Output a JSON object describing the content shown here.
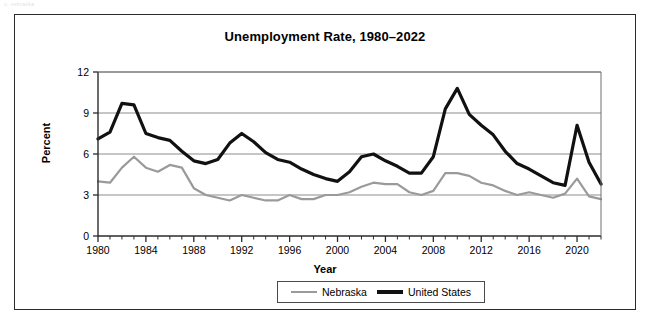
{
  "scan_artifact": {
    "text": "u. nebraska"
  },
  "figure": {
    "title": "Unemployment Rate, 1980–2022",
    "x_axis_title": "Year",
    "y_axis_title": "Percent"
  },
  "legend": {
    "position": "bottom-center",
    "entries": [
      {
        "label": "Nebraska",
        "color": "#9a9a9a",
        "swatch": "line-swatch-nebraska"
      },
      {
        "label": "United States",
        "color": "#111111",
        "swatch": "line-swatch-united-states"
      }
    ]
  },
  "chart_data": {
    "type": "line",
    "title": "Unemployment Rate, 1980–2022",
    "xlabel": "Year",
    "ylabel": "Percent",
    "xlim": [
      1980,
      2022
    ],
    "ylim": [
      0,
      12
    ],
    "ytick_labels": [
      "0",
      "3",
      "6",
      "9",
      "12"
    ],
    "yticks": [
      0,
      3,
      6,
      9,
      12
    ],
    "xtick_labels": [
      "1980",
      "1984",
      "1988",
      "1992",
      "1996",
      "2000",
      "2004",
      "2008",
      "2012",
      "2016",
      "2020"
    ],
    "xticks_labeled": [
      1980,
      1984,
      1988,
      1992,
      1996,
      2000,
      2004,
      2008,
      2012,
      2016,
      2020
    ],
    "minor_tick_interval_years": 1,
    "grid": "horizontal-only",
    "legend_position": "bottom-center",
    "x": [
      1980,
      1981,
      1982,
      1983,
      1984,
      1985,
      1986,
      1987,
      1988,
      1989,
      1990,
      1991,
      1992,
      1993,
      1994,
      1995,
      1996,
      1997,
      1998,
      1999,
      2000,
      2001,
      2002,
      2003,
      2004,
      2005,
      2006,
      2007,
      2008,
      2009,
      2010,
      2011,
      2012,
      2013,
      2014,
      2015,
      2016,
      2017,
      2018,
      2019,
      2020,
      2021,
      2022
    ],
    "series": [
      {
        "name": "Nebraska",
        "color": "#9a9a9a",
        "line_width": 2.2,
        "values": [
          4.0,
          3.9,
          5.0,
          5.8,
          5.0,
          4.7,
          5.2,
          5.0,
          3.5,
          3.0,
          2.8,
          2.6,
          3.0,
          2.8,
          2.6,
          2.6,
          3.0,
          2.7,
          2.7,
          3.0,
          3.0,
          3.2,
          3.6,
          3.9,
          3.8,
          3.8,
          3.2,
          3.0,
          3.3,
          4.6,
          4.6,
          4.4,
          3.9,
          3.7,
          3.3,
          3.0,
          3.2,
          3.0,
          2.8,
          3.1,
          4.2,
          2.9,
          2.7
        ]
      },
      {
        "name": "United States",
        "color": "#111111",
        "line_width": 3.2,
        "values": [
          7.1,
          7.6,
          9.7,
          9.6,
          7.5,
          7.2,
          7.0,
          6.2,
          5.5,
          5.3,
          5.6,
          6.8,
          7.5,
          6.9,
          6.1,
          5.6,
          5.4,
          4.9,
          4.5,
          4.2,
          4.0,
          4.7,
          5.8,
          6.0,
          5.5,
          5.1,
          4.6,
          4.6,
          5.8,
          9.3,
          10.8,
          8.9,
          8.1,
          7.4,
          6.2,
          5.3,
          4.9,
          4.4,
          3.9,
          3.7,
          8.1,
          5.4,
          3.8
        ]
      }
    ]
  }
}
